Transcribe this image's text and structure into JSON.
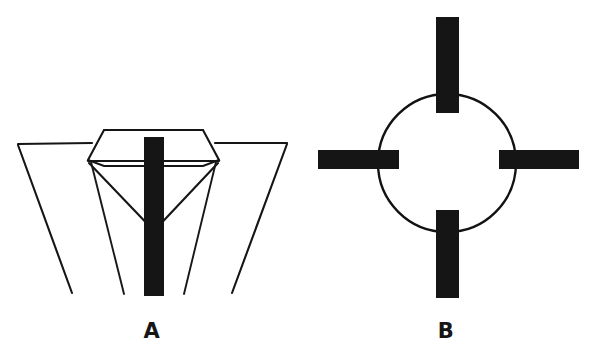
{
  "figure": {
    "title": "",
    "background_color": "#ffffff",
    "ink_color": "#151515",
    "width": 596,
    "height": 359,
    "panels": [
      {
        "id": "panel-a",
        "label": "A",
        "label_x": 152,
        "label_y": 338,
        "description": "Side view of a conical vessel with a hexagonal top plate, inverted triangular inner baffle and a vertical solid black insert bar down the centre",
        "elements": {
          "outer_left_wall": {
            "x1": 18,
            "y1": 144,
            "x2": 72,
            "y2": 292
          },
          "outer_left_rim": {
            "x1": 18,
            "y1": 144,
            "x2": 88,
            "y2": 143
          },
          "outer_right_wall": {
            "x1": 287,
            "y1": 143,
            "x2": 232,
            "y2": 292
          },
          "outer_right_rim": {
            "x1": 287,
            "y1": 143,
            "x2": 219,
            "y2": 143
          },
          "hex_plate_points": "88,160 104,130 203,130 219,160 203,166 104,166",
          "hex_plate_fill": "#ffffff",
          "inner_v_left": {
            "x1": 88,
            "y1": 162,
            "x2": 154,
            "y2": 232
          },
          "inner_v_right": {
            "x1": 219,
            "y1": 162,
            "x2": 154,
            "y2": 232
          },
          "inner_skirt_left": {
            "x1": 90,
            "y1": 161,
            "x2": 124,
            "y2": 293
          },
          "inner_skirt_right": {
            "x1": 217,
            "y1": 161,
            "x2": 184,
            "y2": 293
          },
          "center_bar": {
            "x": 144,
            "y": 137,
            "width": 20,
            "height": 159
          }
        }
      },
      {
        "id": "panel-b",
        "label": "B",
        "label_x": 446,
        "label_y": 338,
        "description": "Top / plan view: open circular ring crossed by four solid black radial bars at top, bottom, left and right",
        "elements": {
          "ring": {
            "cx": 447,
            "cy": 163,
            "r": 69
          },
          "bar_top": {
            "x": 436,
            "y": 17,
            "width": 23,
            "height": 96
          },
          "bar_bottom": {
            "x": 436,
            "y": 210,
            "width": 23,
            "height": 88
          },
          "bar_left": {
            "x": 318,
            "y": 150,
            "width": 81,
            "height": 19
          },
          "bar_right": {
            "x": 499,
            "y": 150,
            "width": 80,
            "height": 19
          }
        }
      }
    ]
  }
}
